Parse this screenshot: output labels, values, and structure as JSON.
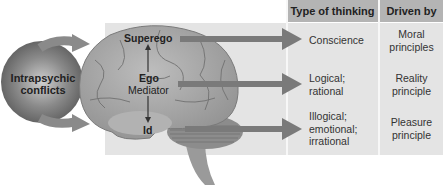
{
  "diagram": {
    "left_label": "Intrapsychic conflicts",
    "left_label_line1": "Intrapsychic",
    "left_label_line2": "conflicts",
    "brain_labels": {
      "superego": "Superego",
      "ego": "Ego",
      "ego_role": "Mediator",
      "id": "Id"
    },
    "table": {
      "headers": [
        "Type of thinking",
        "Driven by"
      ],
      "rows": [
        {
          "structure": "Superego",
          "type_of_thinking": [
            "Conscience"
          ],
          "driven_by": [
            "Moral",
            "principles"
          ]
        },
        {
          "structure": "Ego",
          "type_of_thinking": [
            "Logical;",
            "rational"
          ],
          "driven_by": [
            "Reality",
            "principle"
          ]
        },
        {
          "structure": "Id",
          "type_of_thinking": [
            "Illogical;",
            "emotional;",
            "irrational"
          ],
          "driven_by": [
            "Pleasure",
            "principle"
          ]
        }
      ]
    },
    "colors": {
      "panel": "#e4e4e4",
      "header": "#b4b4b4",
      "arrow": "#7a7a7a",
      "brain": "#a8a8a8",
      "sphere": "#6e6e6e"
    }
  }
}
